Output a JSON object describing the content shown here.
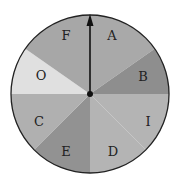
{
  "spinner": {
    "center": [
      90,
      94
    ],
    "radius": 79,
    "outline_color": "#222222",
    "sectors": [
      {
        "label": "A",
        "start": 0,
        "end": 55,
        "color": "#a9a9a9",
        "label_pos": [
          112,
          36
        ]
      },
      {
        "label": "B",
        "start": 55,
        "end": 90,
        "color": "#8e8e8e",
        "label_pos": [
          143,
          77
        ]
      },
      {
        "label": "I",
        "start": 90,
        "end": 135,
        "color": "#b4b4b4",
        "label_pos": [
          148,
          122
        ]
      },
      {
        "label": "D",
        "start": 135,
        "end": 180,
        "color": "#b4b4b4",
        "label_pos": [
          113,
          152
        ]
      },
      {
        "label": "E",
        "start": 180,
        "end": 225,
        "color": "#929292",
        "label_pos": [
          66,
          152
        ]
      },
      {
        "label": "C",
        "start": 225,
        "end": 270,
        "color": "#b0b0b0",
        "label_pos": [
          39,
          122
        ]
      },
      {
        "label": "O",
        "start": 270,
        "end": 305,
        "color": "#e0e0e0",
        "label_pos": [
          41,
          76
        ]
      },
      {
        "label": "F",
        "start": 305,
        "end": 360,
        "color": "#a7a7a7",
        "label_pos": [
          66,
          36
        ]
      }
    ],
    "pointer": {
      "direction": "up",
      "color": "#111111"
    }
  }
}
